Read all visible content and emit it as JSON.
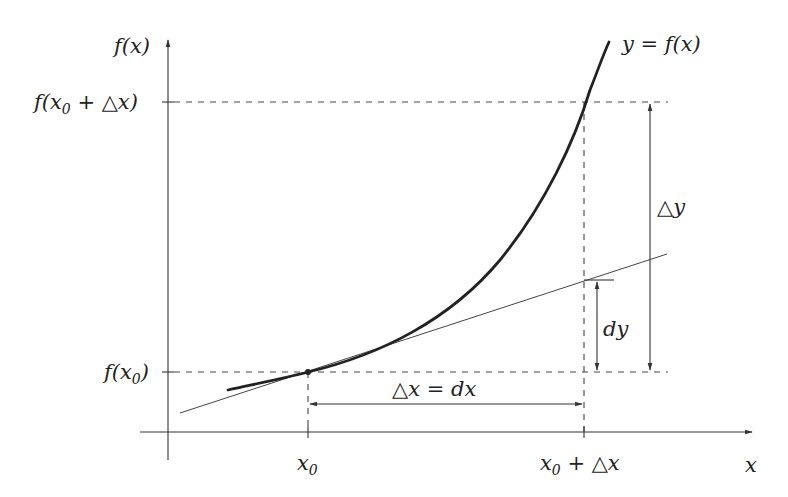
{
  "diagram": {
    "labels": {
      "y_axis": "f(x)",
      "x_axis": "x",
      "curve": "y = f(x)",
      "f_x0": "f(x",
      "f_x0_sub": "0",
      "f_x0_close": ")",
      "f_x0dx": "f(x",
      "f_x0dx_sub": "0",
      "f_x0dx_rest": " + △x)",
      "x0": "x",
      "x0_sub": "0",
      "x0dx": "x",
      "x0dx_sub": "0",
      "x0dx_rest": " + △x",
      "delta_y": "△y",
      "dy": "dy",
      "delta_x": "△x = dx"
    },
    "elements": [
      {
        "name": "curve",
        "desc": "convex increasing curve y = f(x)"
      },
      {
        "name": "tangent-line",
        "desc": "tangent line at point (x0, f(x0))"
      },
      {
        "name": "point-x0",
        "desc": "point of tangency"
      },
      {
        "name": "delta-y-arrow",
        "desc": "vertical double arrow from f(x0) to f(x0+Δx)"
      },
      {
        "name": "dy-arrow",
        "desc": "vertical double arrow from f(x0) to tangent at x0+Δx"
      },
      {
        "name": "delta-x-arrow",
        "desc": "horizontal double arrow from x0 to x0+Δx"
      }
    ]
  }
}
